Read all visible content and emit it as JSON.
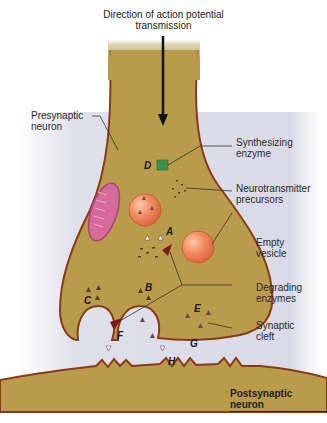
{
  "title": {
    "line1": "Direction of action potential",
    "line2": "transmission"
  },
  "labels": {
    "presynaptic_line1": "Presynaptic",
    "presynaptic_line2": "neuron",
    "synth_line1": "Synthesizing",
    "synth_line2": "enzyme",
    "precursor_line1": "Neurotransmitter",
    "precursor_line2": "precursors",
    "empty_line1": "Empty",
    "empty_line2": "vesicle",
    "degrading_line1": "Degrading",
    "degrading_line2": "enzymes",
    "cleft_line1": "Synaptic",
    "cleft_line2": "cleft",
    "postsynaptic": "Postsynaptic neuron"
  },
  "letters": {
    "A": "A",
    "B": "B",
    "C": "C",
    "D": "D",
    "E": "E",
    "F": "F",
    "G": "G",
    "H": "H"
  },
  "colors": {
    "background_panel": "#dcdde8",
    "neuron_fill": "#b99b4c",
    "neuron_outline": "#8a3a18",
    "vesicle": "#f08a5e",
    "mitochondrion": "#d66a9a",
    "enzyme_green": "#3f8f4f",
    "degrading_enzyme": "#7a1a1a"
  }
}
